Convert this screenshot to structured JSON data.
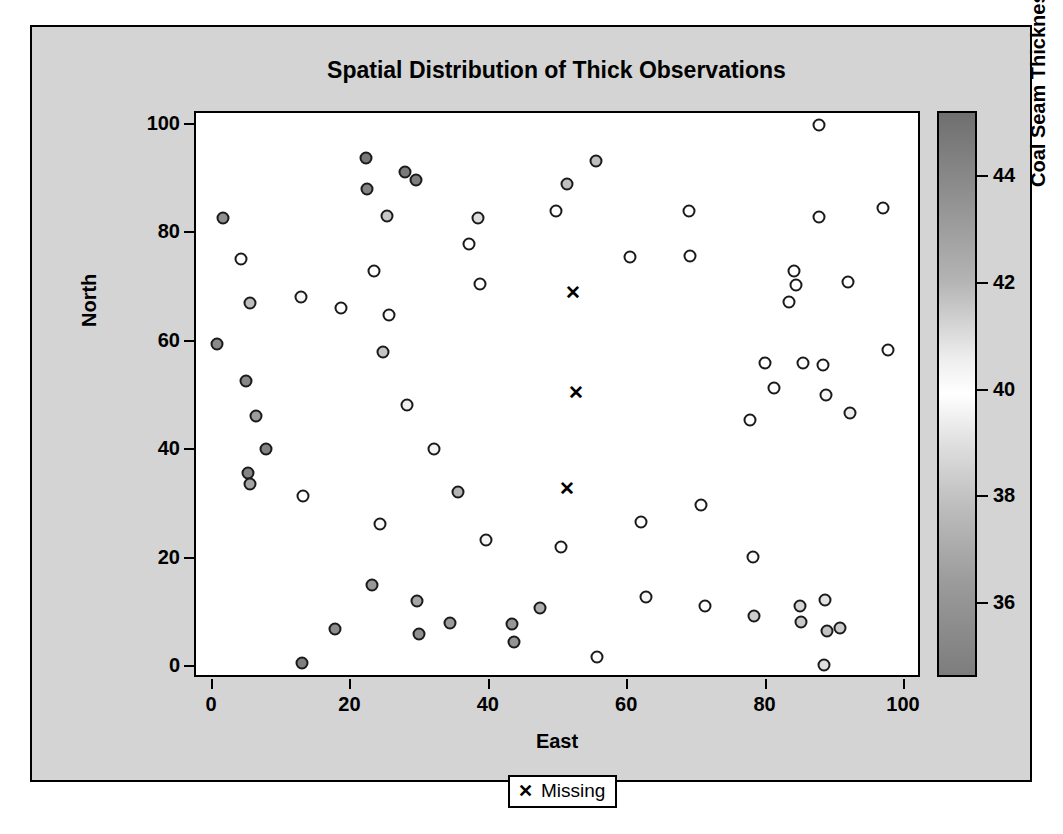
{
  "chart_data": {
    "type": "scatter",
    "title": "Spatial Distribution of Thick Observations",
    "xlabel": "East",
    "ylabel": "North",
    "xlim": [
      0,
      100
    ],
    "ylim": [
      0,
      100
    ],
    "xticks": [
      0,
      20,
      40,
      60,
      80,
      100
    ],
    "yticks": [
      0,
      20,
      40,
      60,
      80,
      100
    ],
    "grid": false,
    "colorbar": {
      "label": "Coal Seam Thickness",
      "ticks": [
        36,
        38,
        40,
        42,
        44
      ],
      "min": 34.6,
      "max": 45.2,
      "gradient": "dark-gray at high and low ends, white near 40"
    },
    "legend": {
      "position": "bottom",
      "entries": [
        {
          "marker": "x",
          "label": "Missing"
        }
      ]
    },
    "series": [
      {
        "name": "Thick Observations",
        "marker": "circle",
        "color_by": "Coal Seam Thickness",
        "points": [
          {
            "east": 1.4,
            "north": 82.8,
            "thick": 41.6,
            "shade": "#8f8f8f"
          },
          {
            "east": 0.6,
            "north": 59.6,
            "thick": 42.2,
            "shade": "#8a8a8a"
          },
          {
            "east": 4.0,
            "north": 75.2,
            "thick": 40.1,
            "shade": "#fdfdfd"
          },
          {
            "east": 5.3,
            "north": 67.2,
            "thick": 40.9,
            "shade": "#bdbdbd"
          },
          {
            "east": 4.7,
            "north": 52.7,
            "thick": 42.4,
            "shade": "#878787"
          },
          {
            "east": 6.2,
            "north": 46.3,
            "thick": 41.9,
            "shade": "#9d9d9d"
          },
          {
            "east": 5.1,
            "north": 35.8,
            "thick": 42.6,
            "shade": "#848484"
          },
          {
            "east": 5.3,
            "north": 33.7,
            "thick": 41.8,
            "shade": "#a5a5a5"
          },
          {
            "east": 7.6,
            "north": 40.2,
            "thick": 42.7,
            "shade": "#828282"
          },
          {
            "east": 12.7,
            "north": 68.2,
            "thick": 40.2,
            "shade": "#f6f6f6"
          },
          {
            "east": 13.0,
            "north": 31.5,
            "thick": 40.0,
            "shade": "#ffffff"
          },
          {
            "east": 12.9,
            "north": 0.7,
            "thick": 42.9,
            "shade": "#7f7f7f"
          },
          {
            "east": 17.7,
            "north": 7.1,
            "thick": 42.3,
            "shade": "#8d8d8d"
          },
          {
            "east": 18.5,
            "north": 66.2,
            "thick": 40.0,
            "shade": "#ffffff"
          },
          {
            "east": 22.1,
            "north": 94.0,
            "thick": 43.4,
            "shade": "#787878"
          },
          {
            "east": 22.2,
            "north": 88.1,
            "thick": 42.7,
            "shade": "#848484"
          },
          {
            "east": 23.3,
            "north": 73.0,
            "thick": 40.0,
            "shade": "#ffffff"
          },
          {
            "east": 23.0,
            "north": 15.2,
            "thick": 42.0,
            "shade": "#989898"
          },
          {
            "east": 24.2,
            "north": 26.4,
            "thick": 40.1,
            "shade": "#fafafa"
          },
          {
            "east": 25.2,
            "north": 83.2,
            "thick": 41.0,
            "shade": "#c7c7c7"
          },
          {
            "east": 27.7,
            "north": 91.3,
            "thick": 43.2,
            "shade": "#7a7a7a"
          },
          {
            "east": 29.4,
            "north": 89.8,
            "thick": 43.0,
            "shade": "#7e7e7e"
          },
          {
            "east": 25.5,
            "north": 65.0,
            "thick": 40.1,
            "shade": "#fcfcfc"
          },
          {
            "east": 24.6,
            "north": 58.1,
            "thick": 41.1,
            "shade": "#c4c4c4"
          },
          {
            "east": 28.0,
            "north": 48.3,
            "thick": 40.3,
            "shade": "#efefef"
          },
          {
            "east": 29.5,
            "north": 12.1,
            "thick": 41.8,
            "shade": "#a6a6a6"
          },
          {
            "east": 29.8,
            "north": 6.1,
            "thick": 42.2,
            "shade": "#909090"
          },
          {
            "east": 31.9,
            "north": 40.3,
            "thick": 40.2,
            "shade": "#f4f4f4"
          },
          {
            "east": 34.3,
            "north": 8.1,
            "thick": 41.9,
            "shade": "#9b9b9b"
          },
          {
            "east": 35.4,
            "north": 32.3,
            "thick": 41.4,
            "shade": "#b5b5b5"
          },
          {
            "east": 37.0,
            "north": 78.0,
            "thick": 40.0,
            "shade": "#ffffff"
          },
          {
            "east": 38.3,
            "north": 82.8,
            "thick": 40.6,
            "shade": "#dcdcdc"
          },
          {
            "east": 38.6,
            "north": 70.7,
            "thick": 40.0,
            "shade": "#ffffff"
          },
          {
            "east": 39.5,
            "north": 23.5,
            "thick": 40.2,
            "shade": "#f5f5f5"
          },
          {
            "east": 43.2,
            "north": 8.0,
            "thick": 42.0,
            "shade": "#979797"
          },
          {
            "east": 43.5,
            "north": 4.7,
            "thick": 42.1,
            "shade": "#949494"
          },
          {
            "east": 47.3,
            "north": 10.8,
            "thick": 41.7,
            "shade": "#adadad"
          },
          {
            "east": 49.5,
            "north": 84.2,
            "thick": 40.0,
            "shade": "#ffffff"
          },
          {
            "east": 50.3,
            "north": 22.2,
            "thick": 40.0,
            "shade": "#ffffff"
          },
          {
            "east": 51.2,
            "north": 89.1,
            "thick": 41.2,
            "shade": "#c0c0c0"
          },
          {
            "east": 55.3,
            "north": 93.4,
            "thick": 41.3,
            "shade": "#bebebe"
          },
          {
            "east": 55.5,
            "north": 1.8,
            "thick": 40.1,
            "shade": "#fbfbfb"
          },
          {
            "east": 60.3,
            "north": 75.6,
            "thick": 40.0,
            "shade": "#ffffff"
          },
          {
            "east": 61.8,
            "north": 26.7,
            "thick": 40.0,
            "shade": "#ffffff"
          },
          {
            "east": 62.5,
            "north": 12.9,
            "thick": 40.2,
            "shade": "#f7f7f7"
          },
          {
            "east": 68.8,
            "north": 84.1,
            "thick": 40.0,
            "shade": "#ffffff"
          },
          {
            "east": 68.9,
            "north": 75.9,
            "thick": 40.0,
            "shade": "#ffffff"
          },
          {
            "east": 70.5,
            "north": 29.8,
            "thick": 40.0,
            "shade": "#ffffff"
          },
          {
            "east": 71.1,
            "north": 11.2,
            "thick": 40.1,
            "shade": "#fdfdfd"
          },
          {
            "east": 77.6,
            "north": 45.5,
            "thick": 40.0,
            "shade": "#ffffff"
          },
          {
            "east": 78.0,
            "north": 20.3,
            "thick": 40.1,
            "shade": "#fafafa"
          },
          {
            "east": 78.2,
            "north": 9.5,
            "thick": 40.9,
            "shade": "#cdcdcd"
          },
          {
            "east": 79.7,
            "north": 56.0,
            "thick": 40.0,
            "shade": "#ffffff"
          },
          {
            "east": 81.1,
            "north": 51.4,
            "thick": 40.0,
            "shade": "#ffffff"
          },
          {
            "east": 83.9,
            "north": 73.1,
            "thick": 40.0,
            "shade": "#ffffff"
          },
          {
            "east": 84.3,
            "north": 70.5,
            "thick": 40.0,
            "shade": "#ffffff"
          },
          {
            "east": 83.3,
            "north": 67.3,
            "thick": 40.0,
            "shade": "#ffffff"
          },
          {
            "east": 85.3,
            "north": 56.0,
            "thick": 40.0,
            "shade": "#ffffff"
          },
          {
            "east": 84.8,
            "north": 11.2,
            "thick": 40.8,
            "shade": "#d4d4d4"
          },
          {
            "east": 84.9,
            "north": 8.3,
            "thick": 41.0,
            "shade": "#c9c9c9"
          },
          {
            "east": 87.5,
            "north": 100.0,
            "thick": 40.0,
            "shade": "#ffffff"
          },
          {
            "east": 87.6,
            "north": 83.1,
            "thick": 40.0,
            "shade": "#ffffff"
          },
          {
            "east": 88.1,
            "north": 55.7,
            "thick": 40.0,
            "shade": "#ffffff"
          },
          {
            "east": 88.6,
            "north": 50.1,
            "thick": 40.2,
            "shade": "#f5f5f5"
          },
          {
            "east": 88.4,
            "north": 12.3,
            "thick": 40.6,
            "shade": "#e2e2e2"
          },
          {
            "east": 88.7,
            "north": 6.7,
            "thick": 41.1,
            "shade": "#c2c2c2"
          },
          {
            "east": 88.3,
            "north": 0.4,
            "thick": 40.7,
            "shade": "#dedede"
          },
          {
            "east": 90.6,
            "north": 7.2,
            "thick": 41.0,
            "shade": "#cccccc"
          },
          {
            "east": 91.8,
            "north": 71.1,
            "thick": 40.0,
            "shade": "#ffffff"
          },
          {
            "east": 92.1,
            "north": 46.8,
            "thick": 40.3,
            "shade": "#ededed"
          },
          {
            "east": 96.8,
            "north": 84.6,
            "thick": 40.0,
            "shade": "#ffffff"
          },
          {
            "east": 97.6,
            "north": 58.5,
            "thick": 40.0,
            "shade": "#ffffff"
          }
        ]
      },
      {
        "name": "Missing",
        "marker": "x",
        "points": [
          {
            "east": 52.0,
            "north": 69.0
          },
          {
            "east": 52.5,
            "north": 50.6
          },
          {
            "east": 51.2,
            "north": 32.8
          }
        ]
      }
    ]
  },
  "legend": {
    "missing_label": "Missing",
    "missing_symbol": "✕"
  }
}
